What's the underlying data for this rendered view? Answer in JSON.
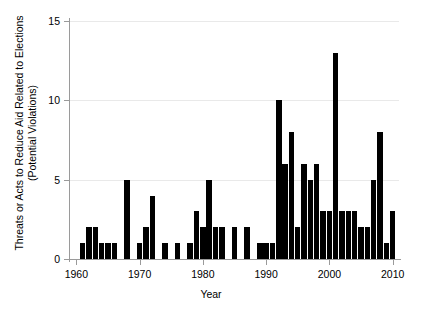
{
  "chart_data": {
    "type": "bar",
    "title": "",
    "xlabel": "Year",
    "ylabel": "Threats or Acts to Reduce Aid Related to Elections (Potential Violations)",
    "ylabel_line1": "Threats or Acts to Reduce Aid Related to Elections",
    "ylabel_line2": "(Potential Violations)",
    "xlim": [
      1959,
      2011
    ],
    "ylim": [
      0,
      15
    ],
    "yticks": [
      0,
      5,
      10,
      15
    ],
    "ytick_labels": [
      "0",
      "5",
      "10",
      "15"
    ],
    "xticks": [
      1960,
      1970,
      1980,
      1990,
      2000,
      2010
    ],
    "xtick_labels": [
      "1960",
      "1970",
      "1980",
      "1990",
      "2000",
      "2010"
    ],
    "grid": true,
    "grid_axis": "y",
    "legend": null,
    "bar_color": "#000000",
    "categories": [
      1960,
      1961,
      1962,
      1963,
      1964,
      1965,
      1966,
      1967,
      1968,
      1969,
      1970,
      1971,
      1972,
      1973,
      1974,
      1975,
      1976,
      1977,
      1978,
      1979,
      1980,
      1981,
      1982,
      1983,
      1984,
      1985,
      1986,
      1987,
      1988,
      1989,
      1990,
      1991,
      1992,
      1993,
      1994,
      1995,
      1996,
      1997,
      1998,
      1999,
      2000,
      2001,
      2002,
      2003,
      2004,
      2005,
      2006,
      2007,
      2008,
      2009,
      2010
    ],
    "values": [
      0,
      1,
      2,
      2,
      1,
      1,
      1,
      0,
      5,
      0,
      1,
      2,
      4,
      0,
      1,
      0,
      1,
      0,
      1,
      3,
      2,
      5,
      2,
      2,
      0,
      2,
      0,
      2,
      0,
      1,
      1,
      1,
      10,
      6,
      8,
      2,
      6,
      5,
      6,
      3,
      3,
      13,
      3,
      3,
      3,
      2,
      2,
      5,
      8,
      1,
      3
    ]
  }
}
